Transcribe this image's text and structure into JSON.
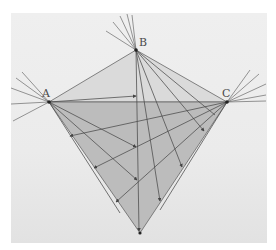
{
  "figure": {
    "paper_color": "#ededed",
    "upper_fill": "#dcdcdc",
    "lower_fill": "#b9b9b9",
    "line_color": "#555555",
    "points": {
      "A": {
        "label": "A",
        "x": 49,
        "y": 102
      },
      "B": {
        "label": "B",
        "x": 136,
        "y": 50
      },
      "C": {
        "label": "C",
        "x": 227,
        "y": 102
      },
      "D": {
        "label": "",
        "x": 140,
        "y": 233
      }
    },
    "labels": {
      "A": "A",
      "B": "B",
      "C": "C"
    }
  }
}
